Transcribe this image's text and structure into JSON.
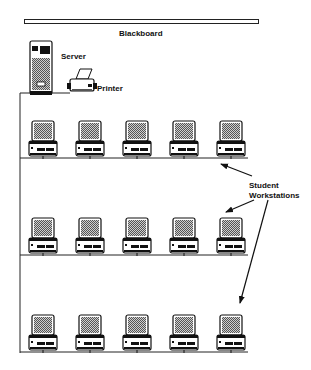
{
  "diagram": {
    "type": "classroom-network-layout",
    "labels": {
      "blackboard": "Blackboard",
      "server": "Server",
      "printer": "Printer",
      "workstations_line1": "Student",
      "workstations_line2": "Workstations"
    },
    "rows": [
      {
        "y": 121,
        "line_y": 158,
        "workstations": 5
      },
      {
        "y": 217,
        "line_y": 255,
        "workstations": 5
      },
      {
        "y": 315,
        "line_y": 352,
        "workstations": 5
      }
    ],
    "workstation_x": [
      29,
      76,
      123,
      170,
      217
    ],
    "colors": {
      "line": "#222222",
      "screen": "#9a9a9a",
      "background": "#ffffff"
    }
  }
}
